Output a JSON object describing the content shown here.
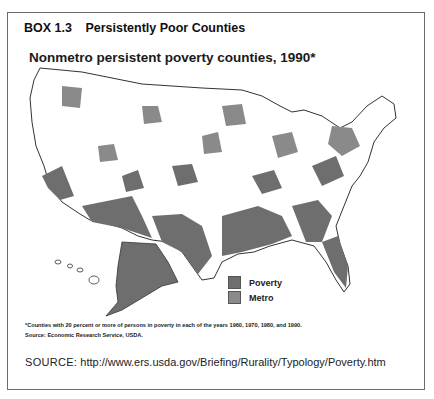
{
  "box": {
    "number": "BOX 1.3",
    "title": "Persistently Poor Counties"
  },
  "map": {
    "title": "Nonmetro persistent poverty counties, 1990*",
    "colors": {
      "poverty": "#6e6e6e",
      "metro": "#8a8a8a",
      "outline": "#333333",
      "background": "#ffffff"
    },
    "legend": [
      {
        "label": "Poverty",
        "color": "#6e6e6e"
      },
      {
        "label": "Metro",
        "color": "#8a8a8a"
      }
    ],
    "footnote": "*Counties with 20 percent or more of persons in poverty in each of the years 1960, 1970, 1980, and 1990.",
    "map_source": "Source: Economic Research Service, USDA."
  },
  "source": {
    "label": "SOURCE:",
    "url": "http://www.ers.usda.gov/Briefing/Rurality/Typology/Poverty.htm"
  }
}
